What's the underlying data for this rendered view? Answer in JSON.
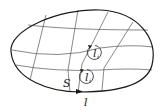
{
  "figure": {
    "type": "surface-with-grid",
    "labels": {
      "surface": "S",
      "boundary": "l",
      "loop_upper": {
        "main": "l",
        "sub": "i"
      },
      "loop_lower": {
        "main": "l",
        "sub": "i"
      }
    },
    "colors": {
      "outline": "#1a1a1a",
      "grid": "#555555",
      "text": "#222222",
      "background": "#ffffff"
    }
  }
}
